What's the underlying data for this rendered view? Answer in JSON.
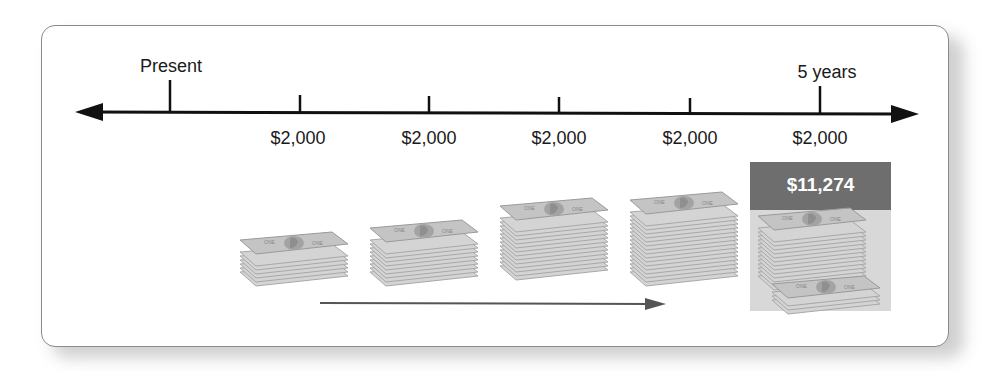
{
  "diagram": {
    "title": "",
    "timeline": {
      "start_label": "Present",
      "end_label": "5 years",
      "payments": [
        {
          "period": 1,
          "amount": "$2,000"
        },
        {
          "period": 2,
          "amount": "$2,000"
        },
        {
          "period": 3,
          "amount": "$2,000"
        },
        {
          "period": 4,
          "amount": "$2,000"
        },
        {
          "period": 5,
          "amount": "$2,000"
        }
      ]
    },
    "future_value": {
      "label": "$11,274"
    },
    "colors": {
      "line": "#111111",
      "highlight_header": "#6e6e6e",
      "highlight_body": "#d8d8d8",
      "money": "#a9a9a9",
      "growth_arrow": "#555555"
    },
    "money_stacks": [
      {
        "period": 1,
        "bills": 6
      },
      {
        "period": 2,
        "bills": 9
      },
      {
        "period": 3,
        "bills": 13
      },
      {
        "period": 4,
        "bills": 16
      },
      {
        "period": 5,
        "bills": 14,
        "extra_stack": true
      }
    ]
  }
}
